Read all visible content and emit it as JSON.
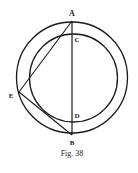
{
  "figure": {
    "caption": "Fig. 38",
    "points": {
      "A": {
        "label": "A",
        "x": 72,
        "y": 20
      },
      "B": {
        "label": "B",
        "x": 72,
        "y": 135
      },
      "C": {
        "label": "C",
        "x": 72,
        "y": 33
      },
      "D": {
        "label": "D",
        "x": 72,
        "y": 122
      },
      "E": {
        "label": "E",
        "x": 19,
        "y": 92
      }
    },
    "circles": [
      {
        "name": "outer-circle",
        "cx": 72,
        "cy": 77.5,
        "r": 56
      },
      {
        "name": "inner-circle",
        "cx": 73,
        "cy": 78,
        "r": 44
      }
    ],
    "segments": [
      "AB",
      "AE",
      "EB"
    ],
    "stroke_color": "#1a1a1a"
  }
}
